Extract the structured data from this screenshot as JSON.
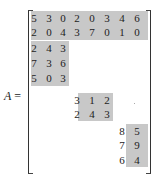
{
  "matrix_label": {
    "name": "A",
    "equals": "="
  },
  "blocks": [
    {
      "id": "top-rows",
      "rows": [
        [
          "5",
          "3",
          "0",
          "2",
          "0",
          "3",
          "4",
          "6"
        ],
        [
          "2",
          "0",
          "4",
          "3",
          "7",
          "0",
          "1",
          "0"
        ]
      ]
    },
    {
      "id": "block-2",
      "rows": [
        [
          "2",
          "4",
          "3"
        ],
        [
          "7",
          "3",
          "6"
        ],
        [
          "5",
          "0",
          "3"
        ]
      ]
    },
    {
      "id": "block-3",
      "rows": [
        [
          "3",
          "1",
          "2"
        ],
        [
          "2",
          "4",
          "3"
        ]
      ]
    },
    {
      "id": "block-4",
      "rows": [
        [
          "8",
          "5"
        ],
        [
          "7",
          "9"
        ],
        [
          "6",
          "4"
        ]
      ]
    }
  ],
  "colors": {
    "block_fill": "#c8c8c8",
    "text": "#222222"
  }
}
